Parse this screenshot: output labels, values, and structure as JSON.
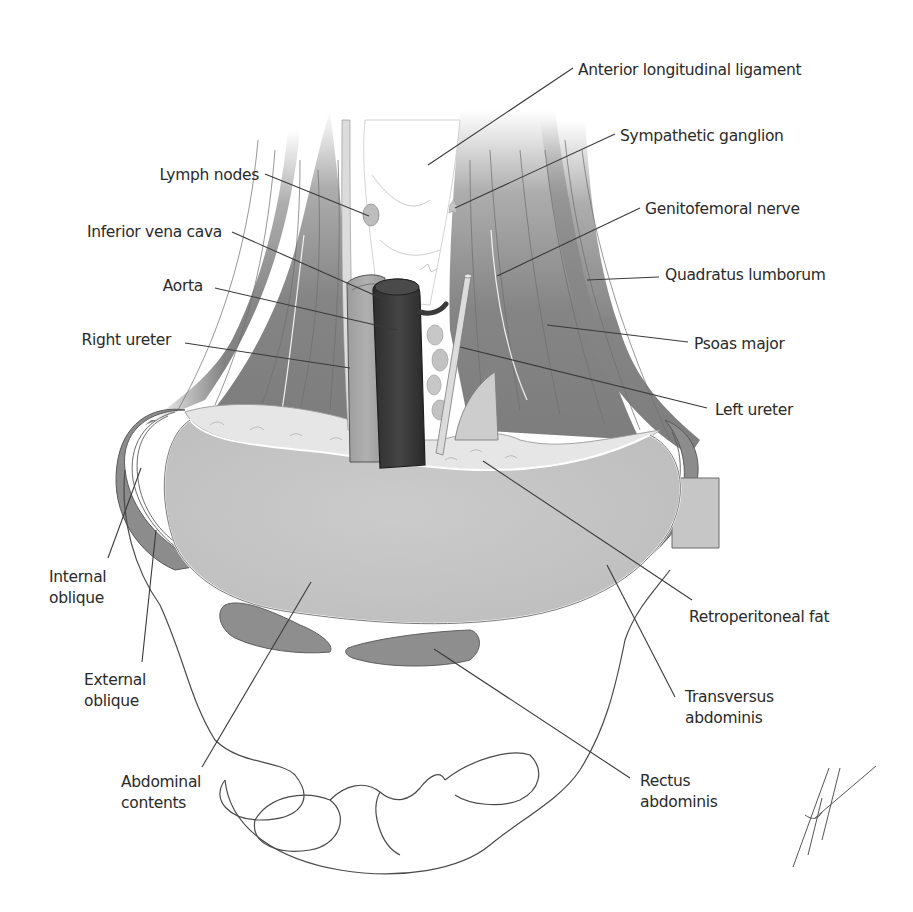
{
  "figure": {
    "colors": {
      "background": "#ffffff",
      "muscle": "#8a8a8a",
      "muscle_dark": "#6f6f6f",
      "abdominal_contents": "#c4c4c4",
      "retroperitoneal_fat": "#e4e4e4",
      "aorta": "#3a3a3a",
      "ivc": "#a8a8a8",
      "ureter": "#d6d6d6",
      "bone_outline": "#4a4a4a",
      "label_text": "#2a2a2a",
      "leader_line": "#3a3a3a"
    }
  },
  "labels": [
    {
      "id": "anterior-longitudinal-ligament",
      "text": "Anterior longitudinal ligament",
      "x": 578,
      "y": 75,
      "anchor": "start",
      "line": [
        [
          573,
          68
        ],
        [
          428,
          165
        ]
      ]
    },
    {
      "id": "sympathetic-ganglion",
      "text": "Sympathetic ganglion",
      "x": 620,
      "y": 141,
      "anchor": "start",
      "line": [
        [
          615,
          134
        ],
        [
          455,
          208
        ]
      ]
    },
    {
      "id": "lymph-nodes",
      "text": "Lymph nodes",
      "x": 259,
      "y": 180,
      "anchor": "end",
      "line": [
        [
          265,
          174
        ],
        [
          369,
          216
        ]
      ]
    },
    {
      "id": "genitofemoral-nerve",
      "text": "Genitofemoral nerve",
      "x": 645,
      "y": 214,
      "anchor": "start",
      "line": [
        [
          640,
          208
        ],
        [
          497,
          276
        ]
      ]
    },
    {
      "id": "inferior-vena-cava",
      "text": "Inferior vena cava",
      "x": 222,
      "y": 237,
      "anchor": "end",
      "line": [
        [
          232,
          232
        ],
        [
          390,
          302
        ]
      ]
    },
    {
      "id": "quadratus-lumborum",
      "text": "Quadratus lumborum",
      "x": 665,
      "y": 280,
      "anchor": "start",
      "line": [
        [
          659,
          277
        ],
        [
          587,
          280
        ]
      ]
    },
    {
      "id": "aorta",
      "text": "Aorta",
      "x": 203,
      "y": 291,
      "anchor": "end",
      "line": [
        [
          215,
          288
        ],
        [
          397,
          330
        ]
      ]
    },
    {
      "id": "psoas-major",
      "text": "Psoas major",
      "x": 694,
      "y": 349,
      "anchor": "start",
      "line": [
        [
          688,
          342
        ],
        [
          547,
          325
        ]
      ]
    },
    {
      "id": "right-ureter",
      "text": "Right ureter",
      "x": 171,
      "y": 345,
      "anchor": "end",
      "line": [
        [
          185,
          343
        ],
        [
          350,
          368
        ]
      ]
    },
    {
      "id": "left-ureter",
      "text": "Left ureter",
      "x": 715,
      "y": 415,
      "anchor": "start",
      "line": [
        [
          707,
          408
        ],
        [
          460,
          347
        ]
      ]
    },
    {
      "id": "internal-oblique",
      "text": "Internal",
      "text2": "oblique",
      "x": 49,
      "y": 582,
      "anchor": "start",
      "line": [
        [
          108,
          558
        ],
        [
          141,
          468
        ]
      ]
    },
    {
      "id": "external-oblique",
      "text": "External",
      "text2": "oblique",
      "x": 84,
      "y": 685,
      "anchor": "start",
      "line": [
        [
          142,
          662
        ],
        [
          156,
          530
        ]
      ]
    },
    {
      "id": "abdominal-contents",
      "text": "Abdominal",
      "text2": "contents",
      "x": 121,
      "y": 787,
      "anchor": "start",
      "line": [
        [
          202,
          767
        ],
        [
          311,
          582
        ]
      ]
    },
    {
      "id": "retroperitoneal-fat",
      "text": "Retroperitoneal fat",
      "x": 689,
      "y": 622,
      "anchor": "start",
      "line": [
        [
          692,
          600
        ],
        [
          483,
          461
        ]
      ]
    },
    {
      "id": "transversus-abdominis",
      "text": "Transversus",
      "text2": "abdominis",
      "x": 685,
      "y": 702,
      "anchor": "start",
      "line": [
        [
          675,
          697
        ],
        [
          607,
          565
        ]
      ]
    },
    {
      "id": "rectus-abdominis",
      "text": "Rectus",
      "text2": "abdominis",
      "x": 640,
      "y": 786,
      "anchor": "start",
      "line": [
        [
          630,
          778
        ],
        [
          434,
          649
        ]
      ]
    }
  ]
}
